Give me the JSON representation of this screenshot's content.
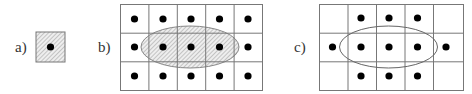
{
  "panels": [
    {
      "label": "a)",
      "description": "single hatched cell with center point"
    },
    {
      "label": "b)",
      "description": "5x3 grid of points with hatched ellipse covering middle row"
    },
    {
      "label": "c)",
      "description": "5x3 grid with points, unfilled ellipse, corner cells empty"
    }
  ],
  "colors": {
    "line": "#777777",
    "dot": "#000000",
    "hatch": "#999999"
  }
}
